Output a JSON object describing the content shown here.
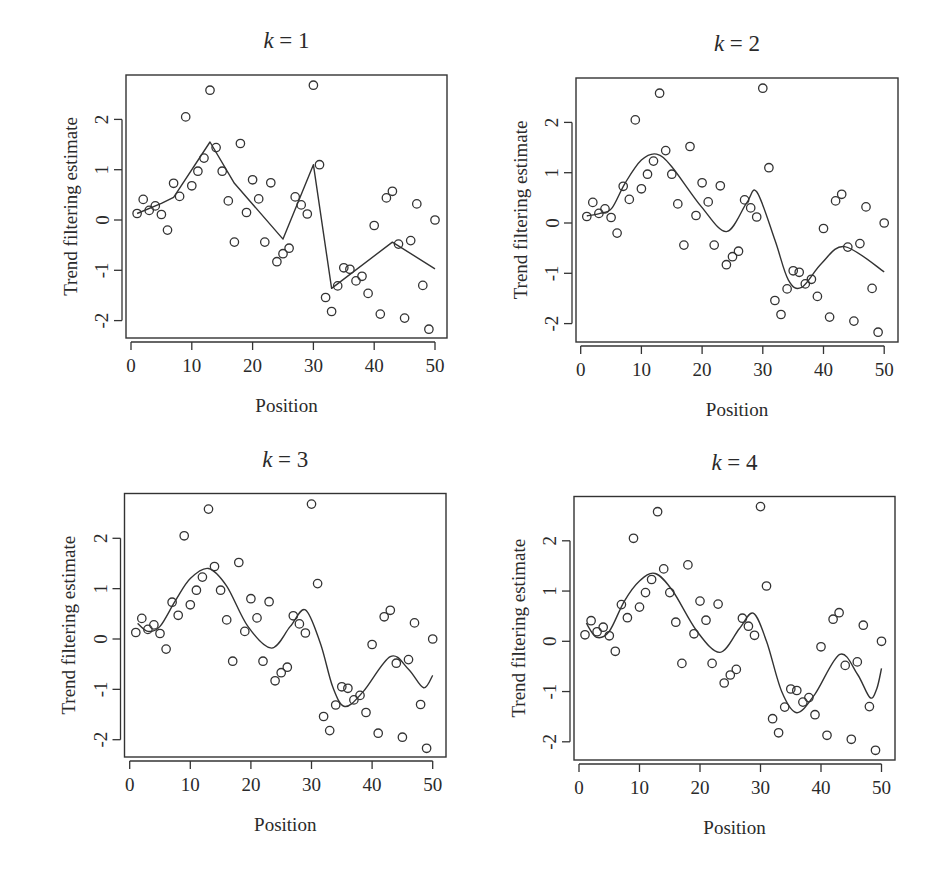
{
  "figure": {
    "layout": "2x2 grid",
    "shared_xlabel": "Position",
    "shared_ylabel": "Trend filtering estimate"
  },
  "chart_data": [
    {
      "type": "scatter",
      "title": "k = 1",
      "title_var": "k",
      "title_value": "1",
      "xlabel": "Position",
      "ylabel": "Trend filtering estimate",
      "xlim": [
        0,
        50
      ],
      "ylim": [
        -2.3,
        2.9
      ],
      "xticks": [
        0,
        10,
        20,
        30,
        40,
        50
      ],
      "yticks": [
        -2,
        -1,
        0,
        1,
        2
      ],
      "grid": false,
      "frame": {
        "left": 126,
        "top": 75,
        "right": 447,
        "bottom": 338
      },
      "px_scale": {
        "x0": 131,
        "x_per_unit": 6.08,
        "y0": 220,
        "y_per_unit": 50.3
      },
      "points": {
        "x": [
          1,
          2,
          3,
          4,
          5,
          6,
          7,
          8,
          9,
          10,
          11,
          12,
          13,
          14,
          15,
          16,
          17,
          18,
          19,
          20,
          21,
          22,
          23,
          24,
          25,
          26,
          27,
          28,
          29,
          30,
          31,
          32,
          33,
          34,
          35,
          36,
          37,
          38,
          39,
          40,
          41,
          42,
          43,
          44,
          45,
          46,
          47,
          48,
          49,
          50
        ],
        "y": [
          0.13,
          0.41,
          0.19,
          0.28,
          0.11,
          -0.2,
          0.73,
          0.47,
          2.05,
          0.68,
          0.97,
          1.23,
          2.58,
          1.44,
          0.97,
          0.38,
          -0.44,
          1.52,
          0.15,
          0.8,
          0.42,
          -0.44,
          0.74,
          -0.83,
          -0.67,
          -0.56,
          0.46,
          0.3,
          0.12,
          2.68,
          1.1,
          -1.54,
          -1.82,
          -1.31,
          -0.95,
          -0.98,
          -1.21,
          -1.12,
          -1.46,
          -0.11,
          -1.87,
          0.44,
          0.57,
          -0.48,
          -1.95,
          -0.41,
          0.32,
          -1.3,
          -2.17,
          0.0
        ]
      },
      "series": [
        {
          "name": "trend filtering fit (k=1)",
          "type": "line",
          "x": [
            1,
            5,
            7,
            13,
            17,
            25,
            30,
            33,
            43,
            50
          ],
          "y": [
            0.13,
            0.33,
            0.45,
            1.55,
            0.73,
            -0.38,
            1.1,
            -1.36,
            -0.44,
            -0.97
          ]
        }
      ]
    },
    {
      "type": "scatter",
      "title": "k = 2",
      "title_var": "k",
      "title_value": "2",
      "xlabel": "Position",
      "ylabel": "Trend filtering estimate",
      "xlim": [
        0,
        50
      ],
      "ylim": [
        -2.3,
        2.9
      ],
      "xticks": [
        0,
        10,
        20,
        30,
        40,
        50
      ],
      "yticks": [
        -2,
        -1,
        0,
        1,
        2
      ],
      "grid": false,
      "frame": {
        "left": 576,
        "top": 78,
        "right": 898,
        "bottom": 342
      },
      "px_scale": {
        "x0": 580.7,
        "x_per_unit": 6.07,
        "y0": 223,
        "y_per_unit": 50.3
      },
      "points": {
        "x": [
          1,
          2,
          3,
          4,
          5,
          6,
          7,
          8,
          9,
          10,
          11,
          12,
          13,
          14,
          15,
          16,
          17,
          18,
          19,
          20,
          21,
          22,
          23,
          24,
          25,
          26,
          27,
          28,
          29,
          30,
          31,
          32,
          33,
          34,
          35,
          36,
          37,
          38,
          39,
          40,
          41,
          42,
          43,
          44,
          45,
          46,
          47,
          48,
          49,
          50
        ],
        "y": [
          0.13,
          0.41,
          0.19,
          0.28,
          0.11,
          -0.2,
          0.73,
          0.47,
          2.05,
          0.68,
          0.97,
          1.23,
          2.58,
          1.44,
          0.97,
          0.38,
          -0.44,
          1.52,
          0.15,
          0.8,
          0.42,
          -0.44,
          0.74,
          -0.83,
          -0.67,
          -0.56,
          0.46,
          0.3,
          0.12,
          2.68,
          1.1,
          -1.54,
          -1.82,
          -1.31,
          -0.95,
          -0.98,
          -1.21,
          -1.12,
          -1.46,
          -0.11,
          -1.87,
          0.44,
          0.57,
          -0.48,
          -1.95,
          -0.41,
          0.32,
          -1.3,
          -2.17,
          0.0
        ]
      },
      "series": [
        {
          "name": "trend filtering fit (k=2)",
          "type": "line",
          "x": [
            1,
            3.2,
            5.1,
            7.3,
            10,
            12.5,
            15,
            19.9,
            24,
            27.3,
            29,
            32,
            34.2,
            36.4,
            39.7,
            43.5,
            50
          ],
          "y": [
            0.14,
            0.19,
            0.29,
            0.79,
            1.25,
            1.37,
            1.12,
            0.32,
            -0.17,
            0.39,
            0.62,
            -0.34,
            -1.13,
            -1.28,
            -0.8,
            -0.47,
            -0.97
          ]
        }
      ]
    },
    {
      "type": "scatter",
      "title": "k = 3",
      "title_var": "k",
      "title_value": "3",
      "xlabel": "Position",
      "ylabel": "Trend filtering estimate",
      "xlim": [
        0,
        50
      ],
      "ylim": [
        -2.3,
        2.9
      ],
      "xticks": [
        0,
        10,
        20,
        30,
        40,
        50
      ],
      "yticks": [
        -2,
        -1,
        0,
        1,
        2
      ],
      "grid": false,
      "frame": {
        "left": 124.5,
        "top": 493.5,
        "right": 446,
        "bottom": 757
      },
      "px_scale": {
        "x0": 129.7,
        "x_per_unit": 6.06,
        "y0": 639,
        "y_per_unit": 50.35
      },
      "points": {
        "x": [
          1,
          2,
          3,
          4,
          5,
          6,
          7,
          8,
          9,
          10,
          11,
          12,
          13,
          14,
          15,
          16,
          17,
          18,
          19,
          20,
          21,
          22,
          23,
          24,
          25,
          26,
          27,
          28,
          29,
          30,
          31,
          32,
          33,
          34,
          35,
          36,
          37,
          38,
          39,
          40,
          41,
          42,
          43,
          44,
          45,
          46,
          47,
          48,
          49,
          50
        ],
        "y": [
          0.13,
          0.41,
          0.19,
          0.28,
          0.11,
          -0.2,
          0.73,
          0.47,
          2.05,
          0.68,
          0.97,
          1.23,
          2.58,
          1.44,
          0.97,
          0.38,
          -0.44,
          1.52,
          0.15,
          0.8,
          0.42,
          -0.44,
          0.74,
          -0.83,
          -0.67,
          -0.56,
          0.46,
          0.3,
          0.12,
          2.68,
          1.1,
          -1.54,
          -1.82,
          -1.31,
          -0.95,
          -0.98,
          -1.21,
          -1.12,
          -1.46,
          -0.11,
          -1.87,
          0.44,
          0.57,
          -0.48,
          -1.95,
          -0.41,
          0.32,
          -1.3,
          -2.17,
          0.0
        ]
      },
      "series": [
        {
          "name": "trend filtering fit (k=3)",
          "type": "line",
          "x": [
            1.3,
            3,
            5,
            7.5,
            10,
            13,
            16,
            19.5,
            23.4,
            26.5,
            29,
            31.5,
            33.5,
            35.5,
            38.5,
            43,
            46,
            48.5,
            50
          ],
          "y": [
            0.31,
            0.15,
            0.25,
            0.75,
            1.2,
            1.4,
            1.05,
            0.25,
            -0.18,
            0.25,
            0.58,
            -0.1,
            -0.95,
            -1.34,
            -1.05,
            -0.35,
            -0.6,
            -0.97,
            -0.72
          ]
        }
      ]
    },
    {
      "type": "scatter",
      "title": "k = 4",
      "title_var": "k",
      "title_value": "4",
      "xlabel": "Position",
      "ylabel": "Trend filtering estimate",
      "xlim": [
        0,
        50
      ],
      "ylim": [
        -2.3,
        2.9
      ],
      "xticks": [
        0,
        10,
        20,
        30,
        40,
        50
      ],
      "yticks": [
        -2,
        -1,
        0,
        1,
        2
      ],
      "grid": false,
      "frame": {
        "left": 574,
        "top": 496.5,
        "right": 895,
        "bottom": 760
      },
      "px_scale": {
        "x0": 579,
        "x_per_unit": 6.05,
        "y0": 641.3,
        "y_per_unit": 50.25
      },
      "points": {
        "x": [
          1,
          2,
          3,
          4,
          5,
          6,
          7,
          8,
          9,
          10,
          11,
          12,
          13,
          14,
          15,
          16,
          17,
          18,
          19,
          20,
          21,
          22,
          23,
          24,
          25,
          26,
          27,
          28,
          29,
          30,
          31,
          32,
          33,
          34,
          35,
          36,
          37,
          38,
          39,
          40,
          41,
          42,
          43,
          44,
          45,
          46,
          47,
          48,
          49,
          50
        ],
        "y": [
          0.13,
          0.41,
          0.19,
          0.28,
          0.11,
          -0.2,
          0.73,
          0.47,
          2.05,
          0.68,
          0.97,
          1.23,
          2.58,
          1.44,
          0.97,
          0.38,
          -0.44,
          1.52,
          0.15,
          0.8,
          0.42,
          -0.44,
          0.74,
          -0.83,
          -0.67,
          -0.56,
          0.46,
          0.3,
          0.12,
          2.68,
          1.1,
          -1.54,
          -1.82,
          -1.31,
          -0.95,
          -0.98,
          -1.21,
          -1.12,
          -1.46,
          -0.11,
          -1.87,
          0.44,
          0.57,
          -0.48,
          -1.95,
          -0.41,
          0.32,
          -1.3,
          -2.17,
          0.0
        ]
      },
      "series": [
        {
          "name": "trend filtering fit (k=4)",
          "type": "line",
          "x": [
            1.2,
            2.9,
            5,
            7.5,
            10,
            12.6,
            15.5,
            19.5,
            23.3,
            26.5,
            28.8,
            31,
            33.5,
            36,
            39,
            43.1,
            46,
            48.1,
            49.2,
            50
          ],
          "y": [
            0.36,
            0.08,
            0.2,
            0.8,
            1.2,
            1.35,
            1.0,
            0.2,
            -0.22,
            0.25,
            0.56,
            0.0,
            -1.0,
            -1.42,
            -1.05,
            -0.26,
            -0.65,
            -1.12,
            -0.95,
            -0.54
          ]
        }
      ]
    }
  ]
}
